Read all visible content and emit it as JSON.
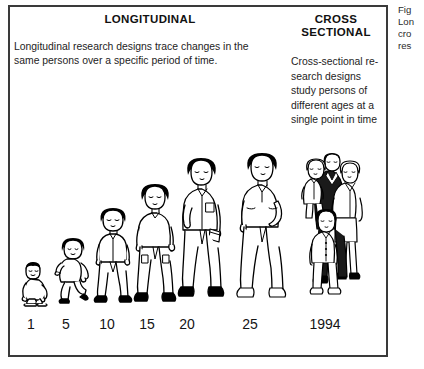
{
  "figure": {
    "longitudinal": {
      "heading": "LONGITUDINAL",
      "description": "Longitudinal research designs trace changes in the same persons over a specific period of time."
    },
    "cross_sectional": {
      "heading_line1": "CROSS",
      "heading_line2": "SECTIONAL",
      "description_lines": [
        "Cross-sectional re-",
        "search designs",
        "study persons of",
        "different ages at a",
        "single point in time"
      ]
    },
    "age_labels": [
      {
        "text": "1",
        "x": 31,
        "figure": "infant-crawling"
      },
      {
        "text": "5",
        "x": 66,
        "figure": "toddler-walking"
      },
      {
        "text": "10",
        "x": 107,
        "figure": "child-standing"
      },
      {
        "text": "15",
        "x": 147,
        "figure": "teen-standing"
      },
      {
        "text": "20",
        "x": 187,
        "figure": "young-adult-with-book"
      },
      {
        "text": "25",
        "x": 250,
        "figure": "adult-hand-on-hip"
      },
      {
        "text": "1994",
        "x": 325,
        "figure": "family-group"
      }
    ]
  },
  "caption": {
    "lines": [
      "Fig",
      "Lon",
      "cro",
      "res"
    ]
  },
  "colors": {
    "ink": "#1a1a1a",
    "border": "#3a3a3a",
    "paper": "#ffffff",
    "fill_dark": "#000000"
  }
}
